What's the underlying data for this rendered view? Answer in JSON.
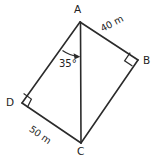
{
  "figure": {
    "type": "geometry-diagram",
    "background_color": "#ffffff",
    "stroke_color": "#2b2b2b",
    "vertices": [
      {
        "name": "A",
        "label": "A",
        "x": 80,
        "y": 22
      },
      {
        "name": "B",
        "label": "B",
        "x": 138,
        "y": 60
      },
      {
        "name": "C",
        "label": "C",
        "x": 81,
        "y": 143
      },
      {
        "name": "D",
        "label": "D",
        "x": 22,
        "y": 103
      }
    ],
    "edges": [
      {
        "from": "A",
        "to": "B"
      },
      {
        "from": "B",
        "to": "C"
      },
      {
        "from": "C",
        "to": "D"
      },
      {
        "from": "D",
        "to": "A"
      },
      {
        "from": "A",
        "to": "C"
      }
    ],
    "measurements": [
      {
        "edge": "AB",
        "label": "40 m",
        "value": 40,
        "unit": "m"
      },
      {
        "edge": "DC",
        "label": "50 m",
        "value": 50,
        "unit": "m"
      }
    ],
    "angles": [
      {
        "at": "A",
        "between": "AD and AC",
        "label": "35°",
        "value": 35,
        "unit": "degrees"
      },
      {
        "at": "B",
        "label": "right-angle",
        "value": 90,
        "unit": "degrees"
      },
      {
        "at": "D",
        "label": "right-angle",
        "value": 90,
        "unit": "degrees"
      }
    ]
  }
}
